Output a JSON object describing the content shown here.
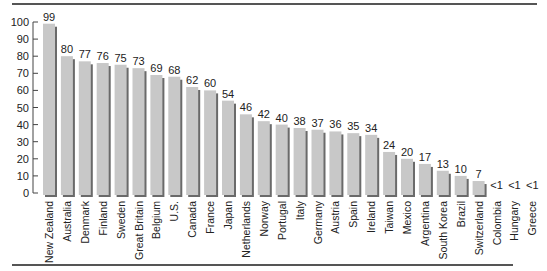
{
  "chart_data": {
    "type": "bar",
    "title": "",
    "xlabel": "",
    "ylabel": "",
    "ylim": [
      0,
      100
    ],
    "yticks": [
      0,
      10,
      20,
      30,
      40,
      50,
      60,
      70,
      80,
      90,
      100
    ],
    "grid": false,
    "legend": null,
    "categories": [
      "New Zealand",
      "Australia",
      "Denmark",
      "Finland",
      "Sweden",
      "Great Britain",
      "Belgium",
      "U.S.",
      "Canada",
      "France",
      "Japan",
      "Netherlands",
      "Norway",
      "Portugal",
      "Italy",
      "Germany",
      "Austria",
      "Spain",
      "Ireland",
      "Taiwan",
      "Mexico",
      "Argentina",
      "South Korea",
      "Brazil",
      "Switzerland",
      "Colombia",
      "Hungary",
      "Greece"
    ],
    "values": [
      99,
      80,
      77,
      76,
      75,
      73,
      69,
      68,
      62,
      60,
      54,
      46,
      42,
      40,
      38,
      37,
      36,
      35,
      34,
      24,
      20,
      17,
      13,
      10,
      7,
      0.5,
      0.5,
      0.5
    ],
    "value_labels": [
      "99",
      "80",
      "77",
      "76",
      "75",
      "73",
      "69",
      "68",
      "62",
      "60",
      "54",
      "46",
      "42",
      "40",
      "38",
      "37",
      "36",
      "35",
      "34",
      "24",
      "20",
      "17",
      "13",
      "10",
      "7",
      "<1",
      "<1",
      "<1"
    ]
  },
  "colors": {
    "bar_fill": "#c8c8c8",
    "bar_shadow": "#6a6a6a",
    "axis": "#444444",
    "rule": "#555555"
  }
}
